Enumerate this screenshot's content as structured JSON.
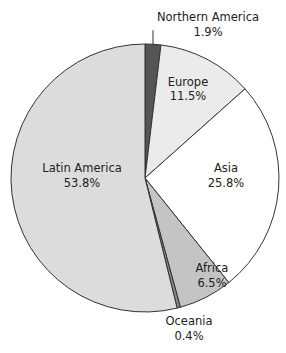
{
  "chart_data": {
    "type": "pie",
    "title": "",
    "start_angle_deg": 0,
    "direction": "clockwise",
    "slices": [
      {
        "label": "Northern America",
        "value": 1.9,
        "value_label": "1.9%",
        "color": "#555555",
        "label_pos": "outside-top"
      },
      {
        "label": "Europe",
        "value": 11.5,
        "value_label": "11.5%",
        "color": "#ebebeb",
        "label_pos": "inside"
      },
      {
        "label": "Asia",
        "value": 25.8,
        "value_label": "25.8%",
        "color": "#ffffff",
        "label_pos": "inside"
      },
      {
        "label": "Africa",
        "value": 6.5,
        "value_label": "6.5%",
        "color": "#c4c4c4",
        "label_pos": "inside"
      },
      {
        "label": "Oceania",
        "value": 0.4,
        "value_label": "0.4%",
        "color": "#888888",
        "label_pos": "outside-bottom"
      },
      {
        "label": "Latin America",
        "value": 53.8,
        "value_label": "53.8%",
        "color": "#dcdcdc",
        "label_pos": "inside"
      }
    ],
    "legend": "none",
    "edge_color": "#333333"
  }
}
